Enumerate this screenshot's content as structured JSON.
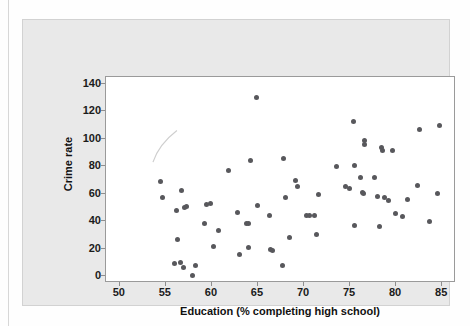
{
  "chart_data": {
    "type": "scatter",
    "title": "",
    "xlabel": "Education (% completing high school)",
    "ylabel": "Crime rate",
    "xlim": [
      48.5,
      86.5
    ],
    "ylim": [
      -5,
      145
    ],
    "xticks": [
      50,
      55,
      60,
      65,
      70,
      75,
      80,
      85
    ],
    "yticks": [
      0,
      20,
      40,
      60,
      80,
      100,
      120,
      140
    ],
    "grid": false,
    "legend": null,
    "marker": {
      "shape": "circle",
      "color": "#58585c",
      "size": 5
    },
    "n_points": 73,
    "annotations": [
      {
        "type": "line-artifact",
        "description": "faint light-gray diagonal stroke in upper-left of plot area",
        "x_from": 53.6,
        "y_from": 83.0,
        "x_to": 56.2,
        "y_to": 106.0
      }
    ],
    "points": [
      {
        "x": 54.4,
        "y": 69.0
      },
      {
        "x": 54.6,
        "y": 57.5
      },
      {
        "x": 55.9,
        "y": 9.5
      },
      {
        "x": 56.1,
        "y": 47.5
      },
      {
        "x": 56.3,
        "y": 26.5
      },
      {
        "x": 56.6,
        "y": 10.0
      },
      {
        "x": 56.7,
        "y": 62.5
      },
      {
        "x": 56.9,
        "y": 6.5
      },
      {
        "x": 57.0,
        "y": 50.0
      },
      {
        "x": 57.2,
        "y": 50.5
      },
      {
        "x": 57.9,
        "y": 0.5
      },
      {
        "x": 58.2,
        "y": 7.5
      },
      {
        "x": 59.2,
        "y": 38.0
      },
      {
        "x": 59.4,
        "y": 52.5
      },
      {
        "x": 59.8,
        "y": 53.0
      },
      {
        "x": 60.2,
        "y": 21.5
      },
      {
        "x": 60.7,
        "y": 33.5
      },
      {
        "x": 61.8,
        "y": 77.0
      },
      {
        "x": 62.8,
        "y": 46.0
      },
      {
        "x": 63.0,
        "y": 16.0
      },
      {
        "x": 63.8,
        "y": 38.5
      },
      {
        "x": 64.0,
        "y": 38.0
      },
      {
        "x": 64.0,
        "y": 21.0
      },
      {
        "x": 64.2,
        "y": 84.5
      },
      {
        "x": 64.8,
        "y": 130.0
      },
      {
        "x": 64.9,
        "y": 51.5
      },
      {
        "x": 66.3,
        "y": 44.0
      },
      {
        "x": 66.4,
        "y": 19.5
      },
      {
        "x": 66.6,
        "y": 19.0
      },
      {
        "x": 67.7,
        "y": 7.5
      },
      {
        "x": 67.8,
        "y": 85.5
      },
      {
        "x": 68.0,
        "y": 57.5
      },
      {
        "x": 68.4,
        "y": 28.0
      },
      {
        "x": 69.1,
        "y": 70.0
      },
      {
        "x": 69.3,
        "y": 65.0
      },
      {
        "x": 70.3,
        "y": 44.5
      },
      {
        "x": 70.6,
        "y": 44.0
      },
      {
        "x": 71.1,
        "y": 44.0
      },
      {
        "x": 71.4,
        "y": 30.5
      },
      {
        "x": 71.6,
        "y": 59.5
      },
      {
        "x": 73.5,
        "y": 79.5
      },
      {
        "x": 74.5,
        "y": 65.5
      },
      {
        "x": 74.9,
        "y": 64.0
      },
      {
        "x": 75.4,
        "y": 112.5
      },
      {
        "x": 75.5,
        "y": 80.5
      },
      {
        "x": 75.5,
        "y": 37.0
      },
      {
        "x": 76.1,
        "y": 72.0
      },
      {
        "x": 76.4,
        "y": 61.0
      },
      {
        "x": 76.5,
        "y": 60.0
      },
      {
        "x": 76.6,
        "y": 99.0
      },
      {
        "x": 76.6,
        "y": 95.5
      },
      {
        "x": 77.6,
        "y": 72.0
      },
      {
        "x": 78.0,
        "y": 58.0
      },
      {
        "x": 78.2,
        "y": 36.5
      },
      {
        "x": 78.4,
        "y": 94.0
      },
      {
        "x": 78.5,
        "y": 91.5
      },
      {
        "x": 78.7,
        "y": 57.0
      },
      {
        "x": 79.2,
        "y": 55.0
      },
      {
        "x": 79.6,
        "y": 91.5
      },
      {
        "x": 79.9,
        "y": 45.5
      },
      {
        "x": 80.7,
        "y": 43.5
      },
      {
        "x": 81.2,
        "y": 56.0
      },
      {
        "x": 82.3,
        "y": 66.0
      },
      {
        "x": 82.5,
        "y": 106.5
      },
      {
        "x": 83.6,
        "y": 39.5
      },
      {
        "x": 84.5,
        "y": 60.5
      },
      {
        "x": 84.7,
        "y": 110.0
      }
    ]
  },
  "axes": {
    "x_title": "Education (% completing high school)",
    "y_title": "Crime rate",
    "x_tick_labels": [
      "50",
      "55",
      "60",
      "65",
      "70",
      "75",
      "80",
      "85"
    ],
    "y_tick_labels": [
      "0",
      "20",
      "40",
      "60",
      "80",
      "100",
      "120",
      "140"
    ]
  },
  "colors": {
    "marker": "#58585c",
    "panel_background": "#e9e9e9",
    "plot_background": "#ffffff",
    "axis_line": "#9a9a9a",
    "text": "#111111"
  }
}
